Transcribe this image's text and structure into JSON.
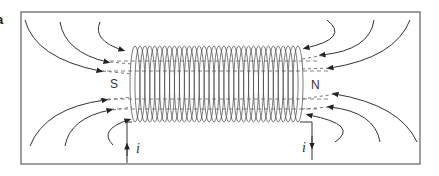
{
  "figure": {
    "panel_label": "a",
    "labels": {
      "south_pole": "S",
      "north_pole": "N",
      "current_in": "i",
      "current_out": "i"
    },
    "coil": {
      "turns": 34
    },
    "colors": {
      "line": "#3a3a3a",
      "frame": "#6a6a6a",
      "background": "#ffffff"
    }
  }
}
